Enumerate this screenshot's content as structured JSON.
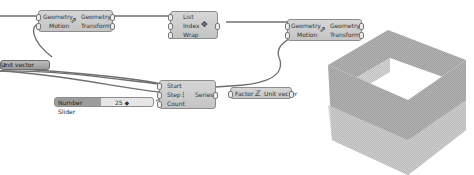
{
  "canvas": {
    "background": "#ffffff"
  },
  "components": {
    "move1": {
      "inputs": [
        "Geometry",
        "Motion"
      ],
      "outputs": [
        "Geometry",
        "Transform"
      ],
      "icon": "move-icon"
    },
    "list_item": {
      "inputs": [
        "List",
        "Index",
        "Wrap"
      ],
      "icon": "list-item-icon"
    },
    "move2": {
      "inputs": [
        "Geometry",
        "Motion"
      ],
      "outputs": [
        "Geometry",
        "Transform"
      ],
      "icon": "move-icon"
    },
    "unit_vector_left": {
      "label": "Unit vector",
      "icon": "unit-z-icon"
    },
    "series": {
      "inputs": [
        "Start",
        "Step",
        "Count"
      ],
      "outputs": [
        "Series"
      ],
      "icon": "series-icon"
    },
    "unit_vector": {
      "inputs": [
        "Factor"
      ],
      "outputs": [
        "Unit vector"
      ],
      "icon": "unit-z-icon"
    },
    "number_slider": {
      "label": "Number Slider",
      "value": "25 ◆"
    }
  },
  "viewport": {
    "object": "hollow-box-of-stacked-curves",
    "colors": {
      "dark": "#8a8a8a",
      "light": "#c8c8c8"
    }
  }
}
